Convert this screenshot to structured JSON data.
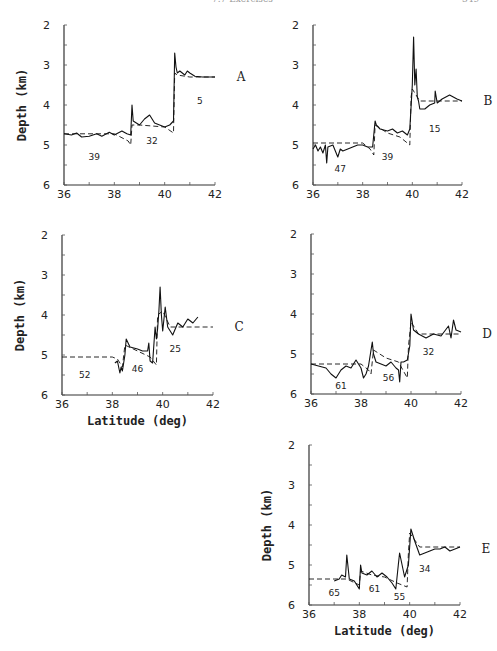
{
  "page_header": {
    "left": "7.7 Exercises",
    "right": "349"
  },
  "chart_data": [
    {
      "type": "line",
      "panel": "A",
      "title": "",
      "xlabel": "",
      "ylabel": "Depth (km)",
      "xlim": [
        36,
        42
      ],
      "ylim": [
        2,
        6
      ],
      "y_inverted": true,
      "xticks": [
        36,
        38,
        40,
        42
      ],
      "yticks": [
        2,
        3,
        4,
        5,
        6
      ],
      "series": [
        {
          "name": "observed",
          "style": "solid",
          "x": [
            36.0,
            36.3,
            36.5,
            36.7,
            37.0,
            37.3,
            37.5,
            37.8,
            38.0,
            38.3,
            38.5,
            38.65,
            38.7,
            38.75,
            39.0,
            39.2,
            39.4,
            39.6,
            39.8,
            40.0,
            40.2,
            40.35,
            40.4,
            40.45,
            40.5,
            40.6,
            40.8,
            40.9,
            41.0,
            41.2,
            41.5,
            42.0
          ],
          "y": [
            4.72,
            4.75,
            4.7,
            4.8,
            4.78,
            4.72,
            4.78,
            4.68,
            4.75,
            4.65,
            4.72,
            4.75,
            4.0,
            4.4,
            4.5,
            4.35,
            4.25,
            4.45,
            4.5,
            4.55,
            4.5,
            4.4,
            2.7,
            3.05,
            3.2,
            3.15,
            3.25,
            3.15,
            3.2,
            3.28,
            3.3,
            3.3
          ]
        },
        {
          "name": "model",
          "style": "dashed",
          "x": [
            36.0,
            38.0,
            38.55,
            38.65,
            38.7,
            39.0,
            40.0,
            40.35,
            40.4,
            40.5,
            41.0,
            42.0
          ],
          "y": [
            4.72,
            4.72,
            4.9,
            5.0,
            4.5,
            4.5,
            4.55,
            4.7,
            3.2,
            3.25,
            3.3,
            3.3
          ]
        }
      ],
      "annotations": [
        {
          "text": "39",
          "x": 37.2,
          "y": 5.3
        },
        {
          "text": "32",
          "x": 39.5,
          "y": 4.9
        },
        {
          "text": "5",
          "x": 41.4,
          "y": 3.9
        },
        {
          "text": "A",
          "position": "right",
          "y": 3.3
        }
      ]
    },
    {
      "type": "line",
      "panel": "B",
      "xlabel": "",
      "ylabel": "",
      "xlim": [
        36,
        42
      ],
      "ylim": [
        2,
        6
      ],
      "y_inverted": true,
      "xticks": [
        36,
        38,
        40,
        42
      ],
      "yticks": [
        2,
        3,
        4,
        5,
        6
      ],
      "series": [
        {
          "name": "observed",
          "style": "solid",
          "x": [
            36.0,
            36.1,
            36.2,
            36.3,
            36.4,
            36.5,
            36.55,
            36.6,
            36.8,
            37.0,
            37.1,
            37.2,
            37.4,
            37.6,
            37.8,
            38.0,
            38.2,
            38.4,
            38.5,
            38.55,
            38.7,
            39.0,
            39.2,
            39.4,
            39.6,
            39.8,
            39.9,
            40.0,
            40.05,
            40.1,
            40.15,
            40.2,
            40.25,
            40.3,
            40.5,
            40.7,
            40.9,
            40.92,
            41.0,
            41.2,
            41.5,
            41.8,
            42.0
          ],
          "y": [
            5.1,
            5.0,
            5.15,
            5.05,
            5.2,
            5.0,
            5.45,
            5.05,
            5.0,
            5.3,
            5.1,
            5.15,
            5.1,
            5.05,
            5.0,
            5.0,
            5.05,
            5.05,
            4.4,
            4.5,
            4.6,
            4.65,
            4.6,
            4.7,
            4.65,
            4.75,
            4.6,
            3.5,
            2.3,
            3.5,
            3.1,
            3.8,
            3.9,
            4.1,
            4.1,
            4.0,
            3.95,
            3.65,
            3.95,
            3.85,
            3.75,
            3.85,
            3.9
          ]
        },
        {
          "name": "model",
          "style": "dashed",
          "x": [
            36.0,
            38.0,
            38.3,
            38.45,
            38.5,
            39.0,
            39.5,
            39.9,
            39.95,
            40.0,
            40.3,
            42.0
          ],
          "y": [
            4.95,
            4.95,
            5.1,
            5.25,
            4.5,
            4.7,
            4.8,
            5.0,
            3.8,
            3.6,
            3.9,
            3.9
          ]
        }
      ],
      "annotations": [
        {
          "text": "47",
          "x": 37.1,
          "y": 5.6
        },
        {
          "text": "39",
          "x": 39.0,
          "y": 5.3
        },
        {
          "text": "15",
          "x": 40.9,
          "y": 4.6
        },
        {
          "text": "B",
          "position": "right",
          "y": 3.9
        }
      ]
    },
    {
      "type": "line",
      "panel": "C",
      "xlabel": "Latitude (deg)",
      "ylabel": "Depth (km)",
      "xlim": [
        36,
        42
      ],
      "ylim": [
        2,
        6
      ],
      "y_inverted": true,
      "xticks": [
        36,
        38,
        40,
        42
      ],
      "yticks": [
        2,
        3,
        4,
        5,
        6
      ],
      "series": [
        {
          "name": "observed",
          "style": "solid",
          "x": [
            38.1,
            38.2,
            38.3,
            38.35,
            38.4,
            38.5,
            38.55,
            38.7,
            39.0,
            39.2,
            39.4,
            39.45,
            39.5,
            39.6,
            39.7,
            39.75,
            39.8,
            39.85,
            39.9,
            39.95,
            40.0,
            40.1,
            40.2,
            40.4,
            40.6,
            40.8,
            41.0,
            41.2,
            41.4
          ],
          "y": [
            5.2,
            5.15,
            5.45,
            5.3,
            5.4,
            5.0,
            4.6,
            4.8,
            4.85,
            4.9,
            4.9,
            4.7,
            5.15,
            5.2,
            4.3,
            4.6,
            4.35,
            3.9,
            3.3,
            4.0,
            4.4,
            3.8,
            4.3,
            4.5,
            4.2,
            4.3,
            4.1,
            4.2,
            4.05
          ]
        },
        {
          "name": "model",
          "style": "dashed",
          "x": [
            36.0,
            38.0,
            38.2,
            38.4,
            38.5,
            39.0,
            39.5,
            39.75,
            39.8,
            40.0,
            40.3,
            42.0
          ],
          "y": [
            5.05,
            5.05,
            5.1,
            5.3,
            4.75,
            4.9,
            5.05,
            5.25,
            4.0,
            3.9,
            4.3,
            4.3
          ]
        }
      ],
      "annotations": [
        {
          "text": "52",
          "x": 36.9,
          "y": 5.5
        },
        {
          "text": "46",
          "x": 39.0,
          "y": 5.35
        },
        {
          "text": "25",
          "x": 40.5,
          "y": 4.85
        },
        {
          "text": "C",
          "position": "right",
          "y": 4.3
        }
      ]
    },
    {
      "type": "line",
      "panel": "D",
      "xlabel": "",
      "ylabel": "",
      "xlim": [
        36,
        42
      ],
      "ylim": [
        2,
        6
      ],
      "y_inverted": true,
      "xticks": [
        36,
        38,
        40,
        42
      ],
      "yticks": [
        2,
        3,
        4,
        5,
        6
      ],
      "series": [
        {
          "name": "observed",
          "style": "solid",
          "x": [
            36.0,
            36.3,
            36.6,
            36.8,
            37.0,
            37.2,
            37.4,
            37.6,
            37.8,
            38.0,
            38.1,
            38.2,
            38.3,
            38.45,
            38.5,
            38.6,
            38.8,
            39.0,
            39.2,
            39.4,
            39.5,
            39.55,
            39.6,
            39.7,
            39.85,
            39.95,
            40.0,
            40.1,
            40.3,
            40.6,
            40.9,
            41.2,
            41.5,
            41.6,
            41.7,
            41.8,
            42.0
          ],
          "y": [
            5.25,
            5.3,
            5.35,
            5.5,
            5.6,
            5.4,
            5.3,
            5.35,
            5.15,
            5.35,
            5.6,
            5.5,
            5.3,
            4.7,
            5.0,
            5.2,
            5.25,
            5.3,
            5.2,
            5.35,
            5.4,
            5.7,
            5.2,
            5.2,
            5.15,
            4.8,
            4.0,
            4.4,
            4.5,
            4.6,
            4.5,
            4.55,
            4.3,
            4.6,
            4.15,
            4.4,
            4.45
          ]
        },
        {
          "name": "model",
          "style": "dashed",
          "x": [
            36.0,
            38.0,
            38.3,
            38.4,
            38.5,
            39.0,
            39.5,
            39.85,
            39.9,
            40.0,
            40.3,
            42.0
          ],
          "y": [
            5.25,
            5.25,
            5.4,
            5.5,
            4.9,
            5.1,
            5.2,
            5.6,
            4.8,
            4.2,
            4.5,
            4.5
          ]
        }
      ],
      "annotations": [
        {
          "text": "61",
          "x": 37.2,
          "y": 5.8
        },
        {
          "text": "56",
          "x": 39.1,
          "y": 5.6
        },
        {
          "text": "32",
          "x": 40.7,
          "y": 4.95
        },
        {
          "text": "D",
          "position": "right",
          "y": 4.5
        }
      ]
    },
    {
      "type": "line",
      "panel": "E",
      "xlabel": "Latitude (deg)",
      "ylabel": "Depth (km)",
      "xlim": [
        36,
        42
      ],
      "ylim": [
        2,
        6
      ],
      "y_inverted": true,
      "xticks": [
        36,
        38,
        40,
        42
      ],
      "yticks": [
        2,
        3,
        4,
        5,
        6
      ],
      "series": [
        {
          "name": "observed",
          "style": "solid",
          "x": [
            37.0,
            37.2,
            37.3,
            37.45,
            37.5,
            37.6,
            37.8,
            38.0,
            38.05,
            38.1,
            38.3,
            38.5,
            38.7,
            38.9,
            39.1,
            39.3,
            39.45,
            39.55,
            39.6,
            39.7,
            39.8,
            39.95,
            40.05,
            40.2,
            40.4,
            40.6,
            40.8,
            41.0,
            41.2,
            41.4,
            41.6,
            41.8,
            42.0
          ],
          "y": [
            5.4,
            5.35,
            5.25,
            5.3,
            4.75,
            5.35,
            5.4,
            5.6,
            5.0,
            5.2,
            5.25,
            5.15,
            5.3,
            5.2,
            5.3,
            5.45,
            5.6,
            5.0,
            4.7,
            5.0,
            5.3,
            5.0,
            4.1,
            4.4,
            4.75,
            4.7,
            4.65,
            4.6,
            4.6,
            4.55,
            4.65,
            4.6,
            4.55
          ]
        },
        {
          "name": "model",
          "style": "dashed",
          "x": [
            36.0,
            37.0,
            37.5,
            38.0,
            38.05,
            38.5,
            39.0,
            39.5,
            39.9,
            39.95,
            40.0,
            40.4,
            42.0
          ],
          "y": [
            5.35,
            5.35,
            5.35,
            5.5,
            5.15,
            5.25,
            5.3,
            5.45,
            5.55,
            4.7,
            4.2,
            4.55,
            4.55
          ]
        }
      ],
      "annotations": [
        {
          "text": "65",
          "x": 37.0,
          "y": 5.7
        },
        {
          "text": "61",
          "x": 38.6,
          "y": 5.6
        },
        {
          "text": "55",
          "x": 39.6,
          "y": 5.8
        },
        {
          "text": "34",
          "x": 40.6,
          "y": 5.1
        },
        {
          "text": "E",
          "position": "right",
          "y": 4.6
        }
      ]
    }
  ]
}
